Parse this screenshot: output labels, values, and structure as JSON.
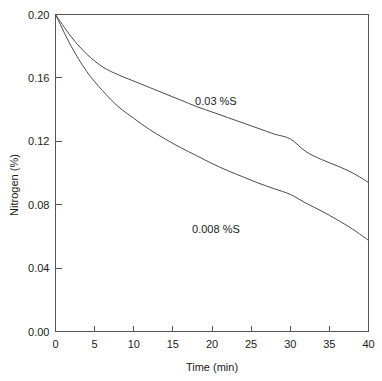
{
  "chart_data": {
    "type": "line",
    "title": "",
    "subtitle": "",
    "xlabel": "Time (min)",
    "ylabel": "Nitrogen (%)",
    "xlim": [
      0,
      40
    ],
    "ylim": [
      0.0,
      0.2
    ],
    "xticks": [
      0,
      5,
      10,
      15,
      20,
      25,
      30,
      35,
      40
    ],
    "xticklabels": [
      "0",
      "5",
      "10",
      "15",
      "20",
      "25",
      "30",
      "35",
      "40"
    ],
    "yticks": [
      0.0,
      0.04,
      0.08,
      0.12,
      0.16,
      0.2
    ],
    "yticklabels": [
      "0.00",
      "0.04",
      "0.08",
      "0.12",
      "0.16",
      "0.20"
    ],
    "grid": false,
    "legend_position": "inline-annotations",
    "x": [
      0,
      2,
      4,
      6,
      8,
      10,
      12,
      14,
      16,
      18,
      20,
      22,
      24,
      26,
      28,
      30,
      32,
      34,
      36,
      38,
      40
    ],
    "series": [
      {
        "name": "0.03 %S",
        "annotation": "0.03 %S",
        "annotation_x": 20.5,
        "annotation_y": 0.1455,
        "values": [
          0.2,
          0.186,
          0.175,
          0.167,
          0.162,
          0.158,
          0.154,
          0.15,
          0.146,
          0.142,
          0.1385,
          0.135,
          0.1315,
          0.128,
          0.1245,
          0.1215,
          0.1135,
          0.1085,
          0.1045,
          0.1,
          0.094
        ]
      },
      {
        "name": "0.008 %S",
        "annotation": "0.008 %S",
        "annotation_x": 20.5,
        "annotation_y": 0.0645,
        "values": [
          0.2,
          0.18,
          0.164,
          0.152,
          0.142,
          0.1345,
          0.1275,
          0.1215,
          0.116,
          0.111,
          0.106,
          0.1015,
          0.0975,
          0.0935,
          0.09,
          0.0865,
          0.081,
          0.076,
          0.0705,
          0.0645,
          0.0575
        ]
      }
    ]
  },
  "axis": {
    "x_title": "Time (min)",
    "y_title": "Nitrogen (%)"
  }
}
